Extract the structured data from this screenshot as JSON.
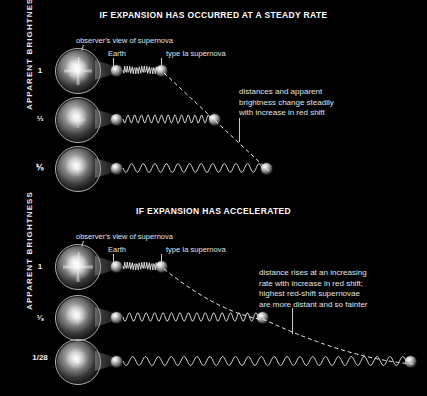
{
  "figure": {
    "axis_label": "APPARENT BRIGHTNESS",
    "background_color": "#000000",
    "text_color": "#e2e2e2"
  },
  "panels": [
    {
      "id": "steady",
      "title": "IF EXPANSION HAS OCCURRED AT A STEADY RATE",
      "callouts": {
        "observer": "observer's view of supernova",
        "earth": "Earth",
        "supernova": "type Ia supernova"
      },
      "note": "distances and apparent\nbrightness change steadily\nwith increase in red shift",
      "rows": [
        {
          "brightness": "1",
          "supernova_x": 161,
          "wave_cycles": 14,
          "wave_amp": 4.0
        },
        {
          "brightness": "⅓",
          "supernova_x": 214,
          "wave_cycles": 13,
          "wave_amp": 4.2
        },
        {
          "brightness": "⅑",
          "supernova_x": 266,
          "wave_cycles": 12,
          "wave_amp": 4.4
        }
      ],
      "trend": {
        "type": "line",
        "label": "linear-distance-trend"
      }
    },
    {
      "id": "accelerated",
      "title": "IF EXPANSION HAS ACCELERATED",
      "callouts": {
        "observer": "observer's view of supernova",
        "earth": "Earth",
        "supernova": "type Ia supernova"
      },
      "note": "distance rises at an increasing\nrate with increase in red shift;\nhighest red-shift supernovae\nare more distant and so fainter",
      "rows": [
        {
          "brightness": "1",
          "supernova_x": 161,
          "wave_cycles": 14,
          "wave_amp": 4.0
        },
        {
          "brightness": "⅛",
          "supernova_x": 262,
          "wave_cycles": 16,
          "wave_amp": 4.3
        },
        {
          "brightness": "1/28",
          "supernova_x": 410,
          "wave_cycles": 22,
          "wave_amp": 4.5
        }
      ],
      "trend": {
        "type": "curve",
        "label": "accelerating-distance-trend"
      }
    }
  ],
  "chart_data": {
    "type": "line",
    "xlabel": "distance (increasing red shift)",
    "ylabel": "APPARENT BRIGHTNESS",
    "series": [
      {
        "name": "IF EXPANSION HAS OCCURRED AT A STEADY RATE",
        "brightness_labels": [
          "1",
          "⅓",
          "⅑"
        ],
        "values": [
          1,
          0.3333,
          0.1111
        ],
        "relative_distance": [
          1,
          2,
          3
        ],
        "trend": "linear"
      },
      {
        "name": "IF EXPANSION HAS ACCELERATED",
        "brightness_labels": [
          "1",
          "⅛",
          "1/28"
        ],
        "values": [
          1,
          0.125,
          0.0357
        ],
        "relative_distance": [
          1,
          2.8,
          5.2
        ],
        "trend": "accelerating"
      }
    ],
    "annotations": [
      "distances and apparent brightness change steadily with increase in red shift",
      "distance rises at an increasing rate with increase in red shift; highest red-shift supernovae are more distant and so fainter"
    ],
    "grid": false,
    "legend": "none"
  }
}
